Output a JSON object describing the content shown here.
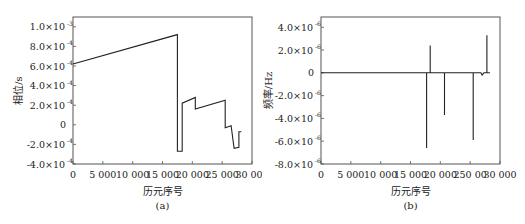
{
  "chart_data": [
    {
      "id": "a",
      "type": "line",
      "caption": "(a)",
      "xlabel": "历元序号",
      "ylabel": "相位/s",
      "xlim": [
        0,
        30000
      ],
      "ylim": [
        -0.0004,
        0.0011
      ],
      "grid": false,
      "legend": null,
      "xticks": [
        0,
        5000,
        10000,
        15000,
        20000,
        25000,
        30000
      ],
      "xtick_labels": [
        "0",
        "5 000",
        "10 000",
        "15 000",
        "20 000",
        "25 000",
        "30 000"
      ],
      "yticks": [
        0.001,
        0.0008,
        0.0006,
        0.0004,
        0.0002,
        0,
        -0.0002,
        -0.0004
      ],
      "ytick_labels": [
        {
          "mant": "1.0×10",
          "exp": "-3"
        },
        {
          "mant": "8.0×10",
          "exp": "-4"
        },
        {
          "mant": "6.0×10",
          "exp": "-4"
        },
        {
          "mant": "4.0×10",
          "exp": "-4"
        },
        {
          "mant": "2.0×10",
          "exp": "-4"
        },
        {
          "mant": "0",
          "exp": ""
        },
        {
          "mant": "-2.0×10",
          "exp": "-4"
        },
        {
          "mant": "-4.0×10",
          "exp": "-4"
        }
      ],
      "series": [
        {
          "name": "phase",
          "x": [
            0,
            17500,
            17500,
            18300,
            18300,
            20500,
            20500,
            25500,
            25500,
            26500,
            27000,
            27000,
            27800,
            27800,
            28200
          ],
          "y": [
            0.00062,
            0.00092,
            -0.00027,
            -0.00027,
            0.00022,
            0.00028,
            0.00016,
            0.00025,
            -3e-05,
            -1e-05,
            -0.00024,
            -0.00024,
            -0.00023,
            -7e-05,
            -7e-05
          ]
        }
      ]
    },
    {
      "id": "b",
      "type": "line",
      "caption": "(b)",
      "xlabel": "历元序号",
      "ylabel": "频率/Hz",
      "xlim": [
        0,
        30000
      ],
      "ylim": [
        -8e-06,
        4.9e-06
      ],
      "grid": false,
      "legend": null,
      "xticks": [
        0,
        5000,
        10000,
        15000,
        20000,
        25000,
        30000
      ],
      "xtick_labels": [
        "0",
        "5 000",
        "10 000",
        "15 000",
        "20 000",
        "250 00",
        "30 000"
      ],
      "yticks": [
        4e-06,
        2e-06,
        0,
        -2e-06,
        -4e-06,
        -6e-06,
        -8e-06
      ],
      "ytick_labels": [
        {
          "mant": "4.0×10",
          "exp": "-6"
        },
        {
          "mant": "2.0×10",
          "exp": "-6"
        },
        {
          "mant": "0",
          "exp": ""
        },
        {
          "mant": "-2.0×10",
          "exp": "-6"
        },
        {
          "mant": "-4.0×10",
          "exp": "-6"
        },
        {
          "mant": "-6.0×10",
          "exp": "-6"
        },
        {
          "mant": "-8.0×10",
          "exp": "-6"
        }
      ],
      "series": [
        {
          "name": "frequency",
          "x": [
            0,
            17700,
            17700,
            17700,
            18300,
            18300,
            18300,
            20700,
            20700,
            20700,
            25500,
            25500,
            25500,
            26800,
            27000,
            27300,
            27800,
            27800,
            27800,
            28300
          ],
          "y": [
            0,
            0,
            -6.6e-06,
            0,
            0,
            2.4e-06,
            0,
            0,
            -3.7e-06,
            0,
            0,
            -5.9e-06,
            0,
            0,
            -2e-07,
            0,
            0,
            3.3e-06,
            0,
            0
          ]
        }
      ]
    }
  ]
}
